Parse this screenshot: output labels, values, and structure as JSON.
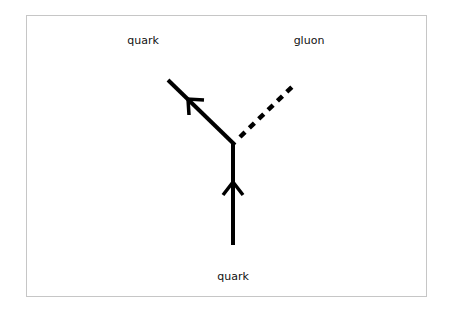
{
  "diagram": {
    "type": "feynman-vertex",
    "labels": {
      "incoming_quark": "quark",
      "outgoing_quark": "quark",
      "gluon": "gluon"
    },
    "colors": {
      "line": "#000000",
      "border": "#c6c6c6",
      "background": "#ffffff"
    },
    "edges": [
      {
        "from": "bottom",
        "to": "vertex",
        "style": "solid",
        "particle": "quark",
        "arrow": "up"
      },
      {
        "from": "vertex",
        "to": "upper-left",
        "style": "solid",
        "particle": "quark",
        "arrow": "up-left"
      },
      {
        "from": "vertex",
        "to": "upper-right",
        "style": "dashed",
        "particle": "gluon",
        "arrow": "none"
      }
    ]
  }
}
